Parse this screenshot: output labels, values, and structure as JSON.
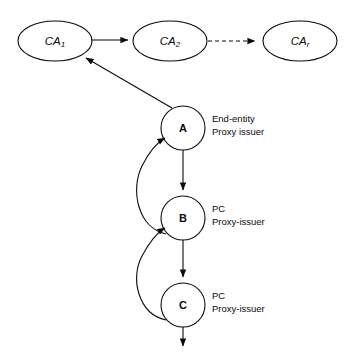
{
  "diagram": {
    "colors": {
      "stroke": "#0b0b0b",
      "fill": "#ffffff",
      "background": "#ffffff"
    },
    "ca_nodes": [
      {
        "id": "ca1",
        "base": "CA",
        "subscript": "1",
        "cx": 55,
        "cy": 41,
        "rx": 37,
        "ry": 20
      },
      {
        "id": "ca2",
        "base": "CA",
        "subscript": "2",
        "cx": 170,
        "cy": 41,
        "rx": 37,
        "ry": 20
      },
      {
        "id": "car",
        "base": "CA",
        "subscript": "r",
        "cx": 300,
        "cy": 41,
        "rx": 37,
        "ry": 20
      }
    ],
    "entity_nodes": [
      {
        "id": "a",
        "label": "A",
        "cx": 183,
        "cy": 128,
        "r": 22,
        "role_line1": "End-entity",
        "role_line2": "Proxy issuer"
      },
      {
        "id": "b",
        "label": "B",
        "cx": 183,
        "cy": 218,
        "r": 22,
        "role_line1": "PC",
        "role_line2": "Proxy-issuer"
      },
      {
        "id": "c",
        "label": "C",
        "cx": 183,
        "cy": 305,
        "r": 22,
        "role_line1": "PC",
        "role_line2": "Proxy-issuer"
      }
    ],
    "edges": [
      {
        "id": "ca1-to-ca2",
        "style": "solid",
        "from": "ca1",
        "to": "ca2"
      },
      {
        "id": "ca2-to-car",
        "style": "dashed",
        "from": "ca2",
        "to": "car"
      },
      {
        "id": "a-to-ca1",
        "style": "solid",
        "from": "a",
        "to": "ca1"
      },
      {
        "id": "a-to-b",
        "style": "solid",
        "from": "a",
        "to": "b"
      },
      {
        "id": "b-to-a-curve",
        "style": "solid-curved",
        "from": "b",
        "to": "a"
      },
      {
        "id": "b-to-c",
        "style": "solid",
        "from": "b",
        "to": "c"
      },
      {
        "id": "c-to-b-curve",
        "style": "solid-curved",
        "from": "c",
        "to": "b"
      },
      {
        "id": "c-to-down",
        "style": "solid",
        "from": "c",
        "to": "continuation"
      }
    ]
  }
}
